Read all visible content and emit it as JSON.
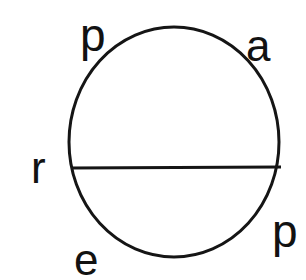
{
  "figure": {
    "background_color": "#ffffff",
    "stroke_color": "#151515",
    "text_color": "#121212",
    "circle": {
      "center_x": 174,
      "center_y": 142,
      "radius_x": 105,
      "radius_y": 115,
      "stroke_width": 3
    },
    "chord": {
      "x1": 71,
      "y1": 168,
      "x2": 281,
      "y2": 167,
      "stroke_width": 3
    },
    "labels": [
      {
        "id": "p-top",
        "text": "p",
        "position": "top-left"
      },
      {
        "id": "a-top",
        "text": "a",
        "position": "top-right"
      },
      {
        "id": "p-bottom",
        "text": "p",
        "position": "bottom-right"
      },
      {
        "id": "e-bottom",
        "text": "e",
        "position": "bottom-left"
      },
      {
        "id": "r-left",
        "text": "r",
        "position": "middle-left"
      }
    ]
  }
}
